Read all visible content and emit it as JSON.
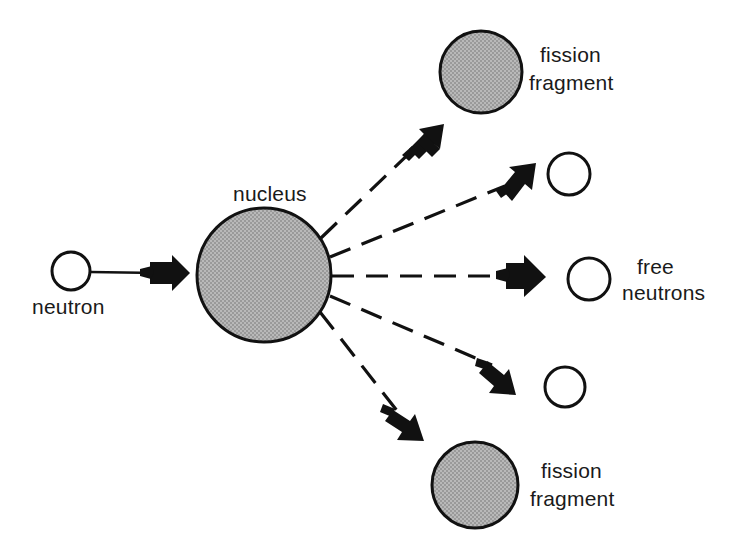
{
  "diagram": {
    "colors": {
      "stroke": "#111111",
      "fill_gray": "#a8a8a8",
      "background": "#ffffff",
      "text": "#1a1a1a"
    },
    "labels": {
      "neutron": "neutron",
      "nucleus": "nucleus",
      "fission_top_line1": "fission",
      "fission_top_line2": "fragment",
      "fission_bottom_line1": "fission",
      "fission_bottom_line2": "fragment",
      "free_neutrons_line1": "free",
      "free_neutrons_line2": "neutrons"
    },
    "nodes": {
      "incoming_neutron": {
        "cx": 71,
        "cy": 271,
        "r": 19
      },
      "nucleus": {
        "cx": 264,
        "cy": 275,
        "r": 67
      },
      "fragment_top": {
        "cx": 481,
        "cy": 72,
        "r": 41
      },
      "fragment_bottom": {
        "cx": 475,
        "cy": 485,
        "r": 43
      },
      "neutron_upper": {
        "cx": 569,
        "cy": 174,
        "r": 21
      },
      "neutron_middle": {
        "cx": 589,
        "cy": 279,
        "r": 21
      },
      "neutron_lower": {
        "cx": 565,
        "cy": 387,
        "r": 20
      }
    },
    "emission_count": 5,
    "fragment_count": 2,
    "free_neutron_count": 3
  }
}
